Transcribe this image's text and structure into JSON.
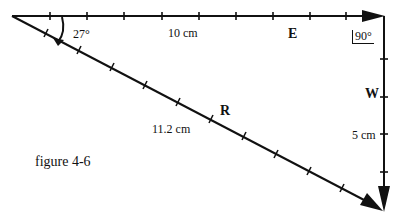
{
  "figure": {
    "caption": "figure 4-6",
    "vectors": {
      "E": {
        "label": "E",
        "length_label": "10 cm"
      },
      "W": {
        "label": "W",
        "length_label": "5 cm"
      },
      "R": {
        "label": "R",
        "length_label": "11.2 cm"
      }
    },
    "angles": {
      "origin": "27°",
      "corner": "90°"
    },
    "colors": {
      "ink": "#111111",
      "background": "#ffffff"
    }
  }
}
